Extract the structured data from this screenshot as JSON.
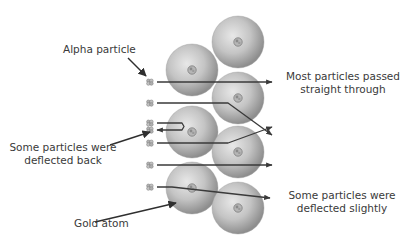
{
  "title_faded": "",
  "labels": {
    "alpha_particle": "Alpha particle",
    "passed_line1": "Most particles passed",
    "passed_line2": "straight through",
    "deflected_back_line1": "Some particles were",
    "deflected_back_line2": "deflected back",
    "deflected_slightly_line1": "Some particles were",
    "deflected_slightly_line2": "deflected slightly",
    "gold_atom": "Gold atom"
  },
  "colors": {
    "atom_light": "#e2e2e2",
    "atom_dark": "#8e8e8e",
    "track": "#3a3a3a",
    "text": "#3a3a3a",
    "background": "#ffffff"
  },
  "atoms": [
    {
      "id": "left-1",
      "cx": 192,
      "cy": 70,
      "r": 26
    },
    {
      "id": "left-2",
      "cx": 192,
      "cy": 132,
      "r": 26
    },
    {
      "id": "left-3",
      "cx": 192,
      "cy": 188,
      "r": 26
    },
    {
      "id": "right-1",
      "cx": 238,
      "cy": 42,
      "r": 26
    },
    {
      "id": "right-2",
      "cx": 238,
      "cy": 98,
      "r": 26
    },
    {
      "id": "right-3",
      "cx": 238,
      "cy": 152,
      "r": 26
    },
    {
      "id": "right-4",
      "cx": 238,
      "cy": 208,
      "r": 26
    }
  ],
  "particles": [
    {
      "id": "p1",
      "x": 150,
      "y": 82
    },
    {
      "id": "p2",
      "x": 150,
      "y": 103
    },
    {
      "id": "p3",
      "x": 150,
      "y": 123
    },
    {
      "id": "p4",
      "x": 150,
      "y": 130
    },
    {
      "id": "p5",
      "x": 150,
      "y": 143
    },
    {
      "id": "p6",
      "x": 150,
      "y": 165
    },
    {
      "id": "p7",
      "x": 150,
      "y": 187
    }
  ],
  "tracks": [
    {
      "id": "straight-1",
      "type": "passed-straight",
      "points": "157,82 272,82"
    },
    {
      "id": "deflect-down",
      "type": "deflected",
      "points": "157,103 228,103 272,135"
    },
    {
      "id": "back-bounce",
      "type": "deflected-back",
      "points": "157,123 182,123 184,126.5 182,130 157,130"
    },
    {
      "id": "deflect-up",
      "type": "deflected",
      "points": "157,143 228,143 272,127"
    },
    {
      "id": "straight-2",
      "type": "passed-straight",
      "points": "157,165 272,165"
    },
    {
      "id": "slight-deflect",
      "type": "deflected-slightly",
      "points": "157,187 172,187 270,198"
    }
  ],
  "pointers": [
    {
      "id": "ptr-alpha",
      "points": "128,58 146,76"
    },
    {
      "id": "ptr-back",
      "points": "110,145 150,132"
    },
    {
      "id": "ptr-gold",
      "points": "95,222 176,203"
    }
  ]
}
